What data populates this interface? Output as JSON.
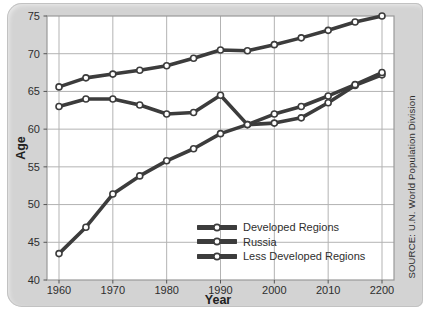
{
  "chart_data": {
    "type": "line",
    "title": "",
    "xlabel": "Year",
    "ylabel": "Age",
    "source": "SOURCE: U.N. World Population Division",
    "x_years": [
      1960,
      1965,
      1970,
      1975,
      1980,
      1985,
      1990,
      1995,
      2000,
      2005,
      2010,
      2015,
      2020
    ],
    "x_tick_years": [
      1960,
      1970,
      1980,
      1990,
      2000,
      2010,
      2020
    ],
    "x_tick_labels": [
      "1960",
      "1970",
      "1980",
      "1990",
      "2000",
      "2010",
      "2200"
    ],
    "y_ticks": [
      40,
      45,
      50,
      55,
      60,
      65,
      70,
      75
    ],
    "ylim": [
      40,
      75
    ],
    "grid": true,
    "legend_position": "inside lower right",
    "series": [
      {
        "name": "Developed Regions",
        "values": [
          65.6,
          66.8,
          67.3,
          67.8,
          68.4,
          69.4,
          70.5,
          70.4,
          71.2,
          72.1,
          73.1,
          74.2,
          75.0
        ]
      },
      {
        "name": "Russia",
        "values": [
          63.0,
          64.0,
          64.0,
          63.2,
          62.0,
          62.2,
          64.5,
          60.6,
          60.8,
          61.5,
          63.5,
          65.8,
          67.2
        ]
      },
      {
        "name": "Less Developed Regions",
        "values": [
          43.5,
          47.0,
          51.4,
          53.8,
          55.8,
          57.4,
          59.4,
          60.6,
          62.0,
          63.0,
          64.4,
          65.9,
          67.5
        ]
      }
    ],
    "colors": {
      "line": "#3c3c3c",
      "marker_fill": "#ffffff",
      "grid_line": "#b3b3b3",
      "plot_border": "#999999",
      "plot_bg": "#ffffff",
      "card_bg": "#d3d3d3",
      "text": "#2e2e2e"
    }
  }
}
